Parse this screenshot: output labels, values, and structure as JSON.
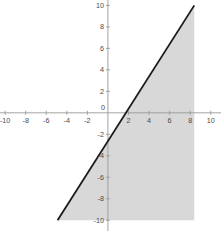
{
  "chart_data": {
    "type": "line",
    "title": "",
    "subtitle": "",
    "xlabel": "",
    "ylabel": "",
    "xlim": [
      -10.5,
      11.0
    ],
    "ylim": [
      -11.0,
      10.5
    ],
    "grid": false,
    "legend": null,
    "axis_color": "#9a9a9a",
    "line_color": "#1a1a1a",
    "shade_color": "#d8d8d8",
    "background_color": "#ffffff",
    "x_ticks": [
      -10,
      -8,
      -6,
      -4,
      -2,
      0,
      2,
      4,
      6,
      8,
      10
    ],
    "y_ticks": [
      10,
      8,
      6,
      4,
      2,
      0,
      -2,
      -4,
      -6,
      -8,
      -10
    ],
    "x_tick_labels": [
      "-10",
      "-8",
      "-6",
      "-4",
      "-2",
      "0",
      "2",
      "4",
      "6",
      "8",
      "10"
    ],
    "y_tick_labels": [
      "10",
      "8",
      "6",
      "4",
      "2",
      "0",
      "-2",
      "-4",
      "-6",
      "-8",
      "-10"
    ],
    "series": [
      {
        "name": "boundary-line",
        "kind": "line",
        "slope": 2.9,
        "intercept": -4.3,
        "x": [
          -4.9,
          8.4
        ],
        "y": [
          -10.0,
          10.0
        ],
        "style": "solid",
        "width": 1.8,
        "color": "#1a1a1a"
      }
    ],
    "shaded_region": {
      "name": "solution-region",
      "description": "region below and right of the boundary line, bounded on the right at x = 8.4 and below at y = -10",
      "inequality": "y <= 2.9x - 4.3",
      "vertices": [
        [
          -4.9,
          -10.0
        ],
        [
          8.4,
          10.0
        ],
        [
          8.4,
          -10.0
        ]
      ],
      "fill": "#d8d8d8",
      "opacity": 1
    },
    "annotations": []
  },
  "figure": {
    "width": 221,
    "height": 231
  }
}
